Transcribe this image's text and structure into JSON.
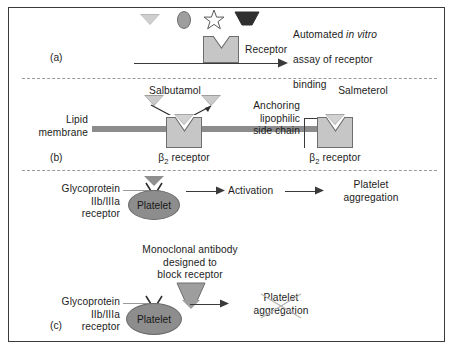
{
  "figure": {
    "panels": [
      "(a)",
      "(b)",
      "(c)"
    ]
  },
  "panel_a": {
    "label": "(a)",
    "ligand_shapes": [
      {
        "name": "triangle-ligand",
        "shape": "triangle-down",
        "fill": "#b9b9b9"
      },
      {
        "name": "ellipse-ligand",
        "shape": "ellipse",
        "fill": "#9e9e9e"
      },
      {
        "name": "star-ligand",
        "shape": "star",
        "fill": "#ffffff"
      },
      {
        "name": "trapezoid-ligand",
        "shape": "trapezoid-down",
        "fill": "#2f2f2f"
      }
    ],
    "receptor_label": "Receptor",
    "assay_text_line1": "Automated ",
    "assay_text_italic": "in vitro",
    "assay_text_line2": "assay of receptor",
    "assay_text_line3": "binding"
  },
  "panel_b": {
    "label": "(b)",
    "drug_left": "Salbutamol",
    "drug_right": "Salmeterol",
    "membrane_label": "Lipid\nmembrane",
    "side_chain_label": "Anchoring\nlipophilic\nside chain",
    "receptor_left": "β",
    "receptor_left_sub": "2",
    "receptor_left_rest": " receptor",
    "receptor_right": "β",
    "receptor_right_sub": "2",
    "receptor_right_rest": " receptor"
  },
  "panel_c": {
    "label": "(c)",
    "top": {
      "receptor_label": "Glycoprotein\nIIb/IIIa\nreceptor",
      "platelet_label": "Platelet",
      "activation_label": "Activation",
      "outcome_label": "Platelet\naggregation"
    },
    "bottom": {
      "antibody_label": "Monoclonal antibody\ndesigned to\nblock receptor",
      "receptor_label": "Glycoprotein\nIIb/IIIa\nreceptor",
      "platelet_label": "Platelet",
      "outcome_label": "Platelet\naggregation",
      "outcome_blocked": true
    }
  },
  "colors": {
    "frame_border": "#3a3a3a",
    "receptor_fill": "#c6c6c6",
    "receptor_stroke": "#6e6e6e",
    "membrane": "#8c8c8c",
    "platelet_fill": "#8d8d8d",
    "ligand_gray": "#b9b9b9",
    "ligand_dark": "#2f2f2f",
    "divider": "#9a9a9a",
    "text": "#1c1c1c"
  }
}
